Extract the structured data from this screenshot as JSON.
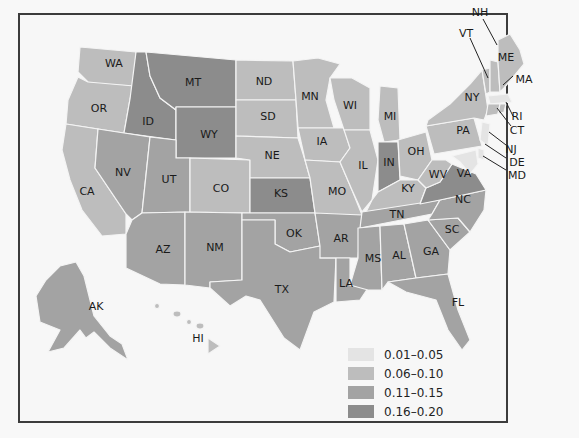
{
  "map": {
    "type": "choropleth",
    "region": "United States",
    "colors": {
      "bin1": "#e4e4e4",
      "bin2": "#bdbdbd",
      "bin3": "#a3a3a3",
      "bin4": "#8c8c8c",
      "border": "#f4f4f4",
      "frame": "#3c3c3c"
    },
    "legend": [
      {
        "label": "0.01–0.05",
        "color": "#e4e4e4"
      },
      {
        "label": "0.06–0.10",
        "color": "#bdbdbd"
      },
      {
        "label": "0.11–0.15",
        "color": "#a3a3a3"
      },
      {
        "label": "0.16–0.20",
        "color": "#8c8c8c"
      }
    ],
    "state_labels": {
      "WA": "WA",
      "OR": "OR",
      "CA": "CA",
      "ID": "ID",
      "NV": "NV",
      "MT": "MT",
      "WY": "WY",
      "UT": "UT",
      "AZ": "AZ",
      "CO": "CO",
      "NM": "NM",
      "ND": "ND",
      "SD": "SD",
      "NE": "NE",
      "KS": "KS",
      "OK": "OK",
      "TX": "TX",
      "MN": "MN",
      "IA": "IA",
      "MO": "MO",
      "AR": "AR",
      "LA": "LA",
      "WI": "WI",
      "IL": "IL",
      "MI": "MI",
      "IN": "IN",
      "OH": "OH",
      "KY": "KY",
      "TN": "TN",
      "MS": "MS",
      "AL": "AL",
      "GA": "GA",
      "FL": "FL",
      "SC": "SC",
      "NC": "NC",
      "VA": "VA",
      "WV": "WV",
      "PA": "PA",
      "NY": "NY",
      "VT": "VT",
      "NH": "NH",
      "ME": "ME",
      "MA": "MA",
      "RI": "RI",
      "CT": "CT",
      "NJ": "NJ",
      "DE": "DE",
      "MD": "MD",
      "AK": "AK",
      "HI": "HI"
    },
    "state_bins": {
      "WA": "0.06–0.10",
      "OR": "0.06–0.10",
      "CA": "0.06–0.10",
      "ID": "0.16–0.20",
      "NV": "0.11–0.15",
      "MT": "0.16–0.20",
      "WY": "0.16–0.20",
      "UT": "0.11–0.15",
      "AZ": "0.11–0.15",
      "CO": "0.06–0.10",
      "NM": "0.11–0.15",
      "ND": "0.06–0.10",
      "SD": "0.06–0.10",
      "NE": "0.06–0.10",
      "KS": "0.16–0.20",
      "OK": "0.11–0.15",
      "TX": "0.11–0.15",
      "MN": "0.06–0.10",
      "IA": "0.06–0.10",
      "MO": "0.06–0.10",
      "AR": "0.11–0.15",
      "LA": "0.11–0.15",
      "WI": "0.06–0.10",
      "IL": "0.06–0.10",
      "MI": "0.06–0.10",
      "IN": "0.16–0.20",
      "OH": "0.06–0.10",
      "KY": "0.06–0.10",
      "TN": "0.11–0.15",
      "MS": "0.11–0.15",
      "AL": "0.11–0.15",
      "GA": "0.11–0.15",
      "FL": "0.11–0.15",
      "SC": "0.11–0.15",
      "NC": "0.11–0.15",
      "VA": "0.16–0.20",
      "WV": "0.06–0.10",
      "PA": "0.06–0.10",
      "NY": "0.06–0.10",
      "VT": "0.06–0.10",
      "NH": "0.06–0.10",
      "ME": "0.06–0.10",
      "MA": "0.01–0.05",
      "RI": "0.06–0.10",
      "CT": "0.06–0.10",
      "NJ": "0.01–0.05",
      "DE": "0.01–0.05",
      "MD": "0.01–0.05",
      "AK": "0.11–0.15",
      "HI": "0.06–0.10"
    }
  }
}
